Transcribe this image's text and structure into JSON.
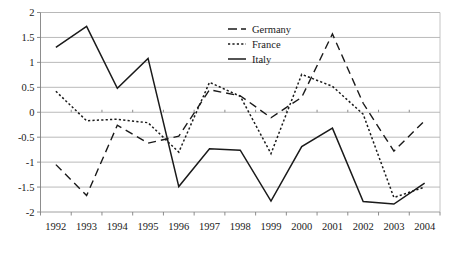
{
  "chart_data": {
    "type": "line",
    "title": "",
    "subtitle": "",
    "xlabel": "",
    "ylabel": "",
    "categories": [
      "1992",
      "1993",
      "1994",
      "1995",
      "1996",
      "1997",
      "1998",
      "1999",
      "2000",
      "2001",
      "2002",
      "2003",
      "2004"
    ],
    "x": [
      1992,
      1993,
      1994,
      1995,
      1996,
      1997,
      1998,
      1999,
      2000,
      2001,
      2002,
      2003,
      2004
    ],
    "series": [
      {
        "name": "Germany",
        "style": "dashed",
        "color": "#1a1a1a",
        "values": [
          -1.05,
          -1.67,
          -0.26,
          -0.62,
          -0.48,
          0.45,
          0.33,
          -0.11,
          0.3,
          1.57,
          0.18,
          -0.78,
          -0.17
        ]
      },
      {
        "name": "France",
        "style": "dotted",
        "color": "#1a1a1a",
        "values": [
          0.42,
          -0.17,
          -0.14,
          -0.21,
          -0.8,
          0.6,
          0.32,
          -0.83,
          0.76,
          0.52,
          -0.04,
          -1.71,
          -1.5
        ]
      },
      {
        "name": "Italy",
        "style": "solid",
        "color": "#1a1a1a",
        "values": [
          1.3,
          1.72,
          0.48,
          1.08,
          -1.49,
          -0.73,
          -0.76,
          -1.78,
          -0.69,
          -0.32,
          -1.79,
          -1.84,
          -1.42
        ]
      }
    ],
    "ylim": [
      -2,
      2
    ],
    "ytick_values": [
      2,
      1.5,
      1,
      0.5,
      0,
      -0.5,
      -1,
      -1.5,
      -2
    ],
    "ytick_labels": [
      "2",
      "1.5",
      "1",
      "0.5",
      "0",
      "-0.5",
      "-1",
      "-1.5",
      "-2"
    ],
    "grid": true,
    "grid_axis": "y",
    "legend_position": "top-center-right",
    "legend_entries": [
      {
        "label": "Germany",
        "style": "dashed"
      },
      {
        "label": "France",
        "style": "dotted"
      },
      {
        "label": "Italy",
        "style": "solid"
      }
    ]
  }
}
